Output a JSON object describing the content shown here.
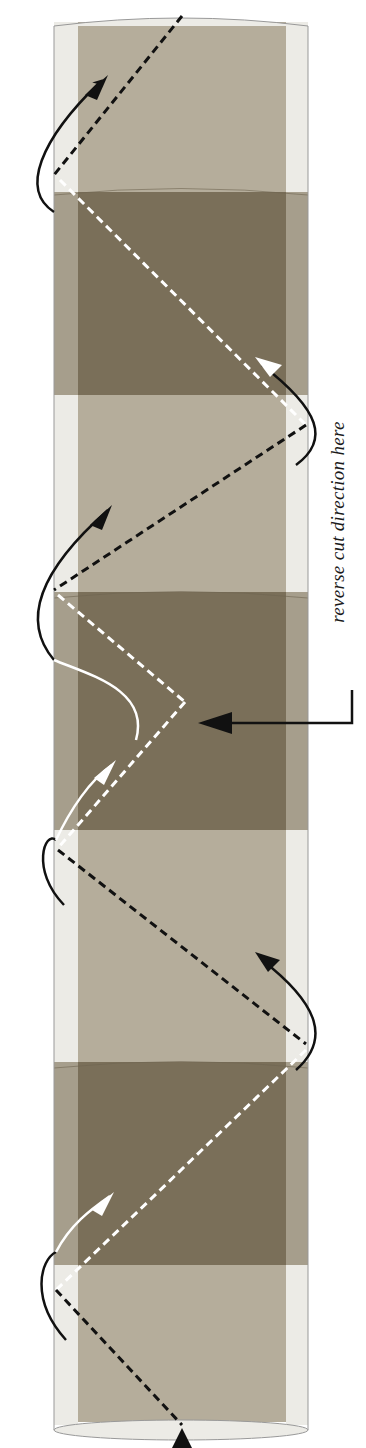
{
  "diagram": {
    "annotation": "reverse cut direction here",
    "colors": {
      "light_band": "#b5ad9b",
      "dark_band": "#7a6f59",
      "edge_light": "#ecebe6",
      "edge_dark": "#a69e8c",
      "cut_line_front": "#111111",
      "cut_line_back": "#ffffff"
    },
    "bands": [
      {
        "type": "light",
        "y0": 20,
        "y1": 190
      },
      {
        "type": "dark",
        "y0": 190,
        "y1": 395
      },
      {
        "type": "light",
        "y0": 395,
        "y1": 590
      },
      {
        "type": "dark",
        "y0": 590,
        "y1": 830
      },
      {
        "type": "light",
        "y0": 830,
        "y1": 1060
      },
      {
        "type": "dark",
        "y0": 1060,
        "y1": 1265
      },
      {
        "type": "light",
        "y0": 1265,
        "y1": 1428
      }
    ]
  }
}
